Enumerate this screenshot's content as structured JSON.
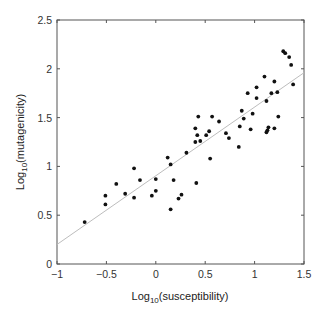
{
  "chart_data": {
    "type": "scatter",
    "title": "",
    "xlabel": "Log10(susceptibility)",
    "ylabel": "Log10(mutagenicity)",
    "xlabel_parts": {
      "base": "Log",
      "sub": "10",
      "rest": "(susceptibility)"
    },
    "ylabel_parts": {
      "base": "Log",
      "sub": "10",
      "rest": "(mutagenicity)"
    },
    "xlim": [
      -1,
      1.5
    ],
    "ylim": [
      0,
      2.5
    ],
    "xticks": [
      -1,
      -0.5,
      0,
      0.5,
      1,
      1.5
    ],
    "xtick_labels": [
      "−1",
      "−0.5",
      "0",
      "0.5",
      "1",
      "1.5"
    ],
    "yticks": [
      0,
      0.5,
      1,
      1.5,
      2,
      2.5
    ],
    "ytick_labels": [
      "0",
      "0.5",
      "1",
      "1.5",
      "2",
      "2.5"
    ],
    "grid": false,
    "legend": null,
    "series": [
      {
        "name": "compounds",
        "marker_color": "#111111",
        "points": [
          [
            -0.72,
            0.43
          ],
          [
            -0.51,
            0.7
          ],
          [
            -0.51,
            0.61
          ],
          [
            -0.4,
            0.82
          ],
          [
            -0.22,
            0.98
          ],
          [
            -0.31,
            0.72
          ],
          [
            -0.22,
            0.68
          ],
          [
            -0.16,
            0.86
          ],
          [
            -0.04,
            0.7
          ],
          [
            0.0,
            0.87
          ],
          [
            0.0,
            0.75
          ],
          [
            0.12,
            1.09
          ],
          [
            0.15,
            1.02
          ],
          [
            0.18,
            0.86
          ],
          [
            0.15,
            0.56
          ],
          [
            0.26,
            0.71
          ],
          [
            0.23,
            0.67
          ],
          [
            0.31,
            1.14
          ],
          [
            0.41,
            0.83
          ],
          [
            0.4,
            1.25
          ],
          [
            0.45,
            1.26
          ],
          [
            0.55,
            1.08
          ],
          [
            0.43,
            1.51
          ],
          [
            0.57,
            1.51
          ],
          [
            0.64,
            1.46
          ],
          [
            0.4,
            1.39
          ],
          [
            0.42,
            1.32
          ],
          [
            0.51,
            1.32
          ],
          [
            0.54,
            1.36
          ],
          [
            0.71,
            1.34
          ],
          [
            0.74,
            1.29
          ],
          [
            0.87,
            1.57
          ],
          [
            0.89,
            1.49
          ],
          [
            0.85,
            1.41
          ],
          [
            0.84,
            1.2
          ],
          [
            0.98,
            1.54
          ],
          [
            0.96,
            1.38
          ],
          [
            0.93,
            1.75
          ],
          [
            1.02,
            1.81
          ],
          [
            1.02,
            1.7
          ],
          [
            1.1,
            1.92
          ],
          [
            1.17,
            1.75
          ],
          [
            1.2,
            1.87
          ],
          [
            1.23,
            1.76
          ],
          [
            1.12,
            1.67
          ],
          [
            1.24,
            1.51
          ],
          [
            1.14,
            1.4
          ],
          [
            1.13,
            1.37
          ],
          [
            1.12,
            1.35
          ],
          [
            1.2,
            1.39
          ],
          [
            1.29,
            2.18
          ],
          [
            1.31,
            2.16
          ],
          [
            1.35,
            2.12
          ],
          [
            1.37,
            2.04
          ],
          [
            1.39,
            1.84
          ]
        ]
      }
    ],
    "fit_line": {
      "name": "regression",
      "color": "#bdbdbd",
      "x": [
        -1,
        1.5
      ],
      "y": [
        0.2,
        1.96
      ]
    }
  }
}
